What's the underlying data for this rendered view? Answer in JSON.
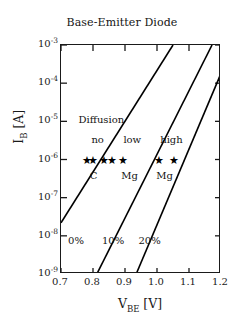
{
  "chart_data": {
    "type": "line",
    "title": "Base-Emitter Diode",
    "xlabel_text": "V",
    "xlabel_sub": "BE",
    "xlabel_unit": "[V]",
    "ylabel_text": "I",
    "ylabel_sub": "B",
    "ylabel_unit": "[A]",
    "xlim": [
      0.7,
      1.2
    ],
    "ylim": [
      1e-09,
      0.001
    ],
    "yscale": "log",
    "grid": false,
    "legend": "none",
    "xticks": [
      {
        "value": 0.7,
        "label": "0.7"
      },
      {
        "value": 0.8,
        "label": "0.8"
      },
      {
        "value": 0.9,
        "label": "0.9"
      },
      {
        "value": 1.0,
        "label": "1.0"
      },
      {
        "value": 1.1,
        "label": "1.1"
      },
      {
        "value": 1.2,
        "label": "1.2"
      }
    ],
    "yticks": [
      {
        "exp": -3,
        "mantissa": "10",
        "label": "10-3"
      },
      {
        "exp": -4,
        "mantissa": "10",
        "label": "10-4"
      },
      {
        "exp": -5,
        "mantissa": "10",
        "label": "10-5"
      },
      {
        "exp": -6,
        "mantissa": "10",
        "label": "10-6"
      },
      {
        "exp": -7,
        "mantissa": "10",
        "label": "10-7"
      },
      {
        "exp": -8,
        "mantissa": "10",
        "label": "10-8"
      },
      {
        "exp": -9,
        "mantissa": "10",
        "label": "10-9"
      }
    ],
    "series": [
      {
        "name": "0%",
        "label": "0%",
        "points": [
          [
            0.7,
            2.2e-08
          ],
          [
            1.05,
            0.001
          ]
        ]
      },
      {
        "name": "10%",
        "label": "10%",
        "points": [
          [
            0.812,
            1e-09
          ],
          [
            1.172,
            0.001
          ]
        ]
      },
      {
        "name": "20%",
        "label": "20%",
        "points": [
          [
            0.935,
            1e-09
          ],
          [
            1.2,
            0.00018
          ]
        ]
      }
    ],
    "annotations": [
      {
        "name": "diffusion-label",
        "text": "Diffusion",
        "x": 0.755,
        "y": 1e-05
      },
      {
        "name": "region-label-no",
        "text": "no",
        "x": 0.795,
        "y": 3e-06
      },
      {
        "name": "region-label-low",
        "text": "low",
        "x": 0.895,
        "y": 3e-06
      },
      {
        "name": "region-label-high",
        "text": "high",
        "x": 1.01,
        "y": 3e-06
      },
      {
        "name": "dopant-label-c",
        "text": "C",
        "x": 0.79,
        "y": 3.4e-07
      },
      {
        "name": "dopant-label-mg-1",
        "text": "Mg",
        "x": 0.888,
        "y": 3.4e-07
      },
      {
        "name": "dopant-label-mg-2",
        "text": "Mg",
        "x": 0.998,
        "y": 3.4e-07
      },
      {
        "name": "curve-label-0pct",
        "text": "0%",
        "x": 0.722,
        "y": 7e-09
      },
      {
        "name": "curve-label-10pct",
        "text": "10%",
        "x": 0.828,
        "y": 7e-09
      },
      {
        "name": "curve-label-20pct",
        "text": "20%",
        "x": 0.942,
        "y": 7e-09
      }
    ],
    "markers": {
      "symbol": "star",
      "y": 1e-06,
      "x_values": [
        0.782,
        0.8,
        0.835,
        0.858,
        0.895,
        1.005,
        1.052
      ]
    }
  }
}
